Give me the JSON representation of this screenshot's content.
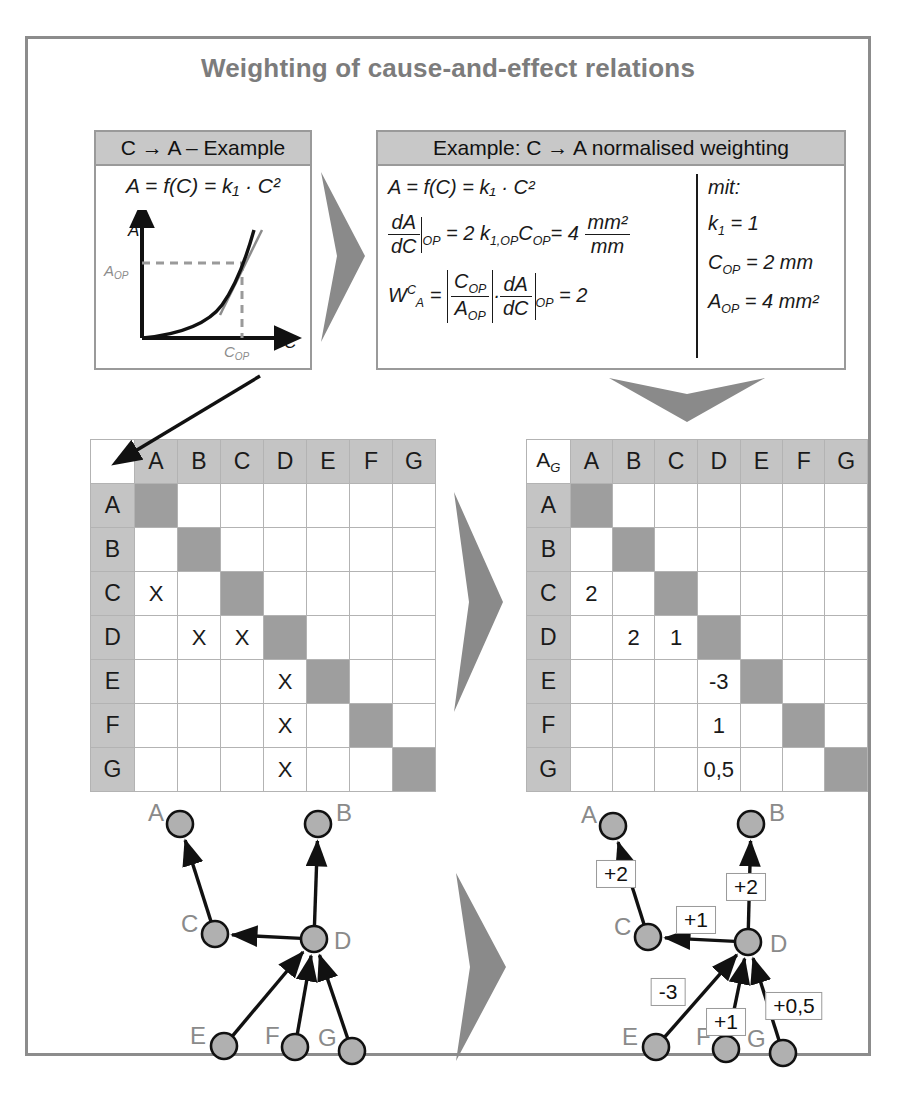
{
  "title": "Weighting of cause-and-effect relations",
  "example_left": {
    "header": "C → A – Example",
    "formula": "A = f(C) = k₁ · C²",
    "axis_y": "A",
    "axis_x": "C",
    "tick_y": "A",
    "tick_y_sub": "OP",
    "tick_x": "C",
    "tick_x_sub": "OP"
  },
  "example_right": {
    "header": "Example: C → A normalised weighting",
    "eq1": "A = f(C) = k₁ · C²",
    "eq2_lhs_num": "dA",
    "eq2_lhs_den": "dC",
    "eq2_at": "OP",
    "eq2_mid": "= 2 k",
    "eq2_k_sub": "1,OP",
    "eq2_c": "C",
    "eq2_c_sub": "OP",
    "eq2_eq": "= 4",
    "eq2_unit_num": "mm²",
    "eq2_unit_den": "mm",
    "eq3_w": "W",
    "eq3_w_sup": "C",
    "eq3_w_sub": "A",
    "eq3_eq": "=",
    "eq3_frac_num": "C",
    "eq3_frac_num_sub": "OP",
    "eq3_frac_den": "A",
    "eq3_frac_den_sub": "OP",
    "eq3_dot": "·",
    "eq3_dA": "dA",
    "eq3_dC": "dC",
    "eq3_at": "OP",
    "eq3_result": "= 2",
    "mit_label": "mit:",
    "mit_lines": [
      {
        "sym": "k",
        "sub": "1",
        "val": "= 1"
      },
      {
        "sym": "C",
        "sub": "OP",
        "val": "= 2 mm"
      },
      {
        "sym": "A",
        "sub": "OP",
        "val": "= 4 mm²"
      }
    ]
  },
  "matrix_left": {
    "corner": "",
    "columns": [
      "A",
      "B",
      "C",
      "D",
      "E",
      "F",
      "G"
    ],
    "rows": [
      "A",
      "B",
      "C",
      "D",
      "E",
      "F",
      "G"
    ],
    "cells": [
      [
        "",
        "",
        "",
        "",
        "",
        "",
        ""
      ],
      [
        "",
        "",
        "",
        "",
        "",
        "",
        ""
      ],
      [
        "X",
        "",
        "",
        "",
        "",
        "",
        ""
      ],
      [
        "",
        "X",
        "X",
        "",
        "",
        "",
        ""
      ],
      [
        "",
        "",
        "",
        "X",
        "",
        "",
        ""
      ],
      [
        "",
        "",
        "",
        "X",
        "",
        "",
        ""
      ],
      [
        "",
        "",
        "",
        "X",
        "",
        "",
        ""
      ]
    ]
  },
  "matrix_right": {
    "corner": "A",
    "corner_sub": "G",
    "columns": [
      "A",
      "B",
      "C",
      "D",
      "E",
      "F",
      "G"
    ],
    "rows": [
      "A",
      "B",
      "C",
      "D",
      "E",
      "F",
      "G"
    ],
    "cells": [
      [
        "",
        "",
        "",
        "",
        "",
        "",
        ""
      ],
      [
        "",
        "",
        "",
        "",
        "",
        "",
        ""
      ],
      [
        "2",
        "",
        "",
        "",
        "",
        "",
        ""
      ],
      [
        "",
        "2",
        "1",
        "",
        "",
        "",
        ""
      ],
      [
        "",
        "",
        "",
        "-3",
        "",
        "",
        ""
      ],
      [
        "",
        "",
        "",
        "1",
        "",
        "",
        ""
      ],
      [
        "",
        "",
        "",
        "0,5",
        "",
        "",
        ""
      ]
    ]
  },
  "graph_left": {
    "nodes": [
      {
        "id": "A",
        "label": "A",
        "x": 90,
        "y": 50,
        "label_dx": -32,
        "label_dy": -13
      },
      {
        "id": "B",
        "label": "B",
        "x": 228,
        "y": 50,
        "label_dx": 18,
        "label_dy": -13
      },
      {
        "id": "C",
        "label": "C",
        "x": 125,
        "y": 160,
        "label_dx": -34,
        "label_dy": -12
      },
      {
        "id": "D",
        "label": "D",
        "x": 224,
        "y": 165,
        "label_dx": 20,
        "label_dy": 0
      },
      {
        "id": "E",
        "label": "E",
        "x": 134,
        "y": 272,
        "label_dx": -34,
        "label_dy": -12
      },
      {
        "id": "F",
        "label": "F",
        "x": 205,
        "y": 273,
        "label_dx": -30,
        "label_dy": -13
      },
      {
        "id": "G",
        "label": "G",
        "x": 262,
        "y": 277,
        "label_dx": -34,
        "label_dy": -15
      }
    ],
    "edges": [
      {
        "from": "C",
        "to": "A"
      },
      {
        "from": "D",
        "to": "B"
      },
      {
        "from": "D",
        "to": "C"
      },
      {
        "from": "E",
        "to": "D"
      },
      {
        "from": "F",
        "to": "D"
      },
      {
        "from": "G",
        "to": "D"
      }
    ]
  },
  "graph_right": {
    "nodes": [
      {
        "id": "A",
        "label": "A",
        "x": 95,
        "y": 52,
        "label_dx": -32,
        "label_dy": -13
      },
      {
        "id": "B",
        "label": "B",
        "x": 233,
        "y": 50,
        "label_dx": 18,
        "label_dy": -13
      },
      {
        "id": "C",
        "label": "C",
        "x": 130,
        "y": 163,
        "label_dx": -34,
        "label_dy": -12
      },
      {
        "id": "D",
        "label": "D",
        "x": 230,
        "y": 168,
        "label_dx": 22,
        "label_dy": 0
      },
      {
        "id": "E",
        "label": "E",
        "x": 138,
        "y": 273,
        "label_dx": -34,
        "label_dy": -12
      },
      {
        "id": "F",
        "label": "F",
        "x": 208,
        "y": 275,
        "label_dx": -30,
        "label_dy": -14
      },
      {
        "id": "G",
        "label": "G",
        "x": 265,
        "y": 279,
        "label_dx": -36,
        "label_dy": -16
      }
    ],
    "edges": [
      {
        "from": "C",
        "to": "A",
        "weight": "+2",
        "lx": 98,
        "ly": 100
      },
      {
        "from": "D",
        "to": "B",
        "weight": "+2",
        "lx": 228,
        "ly": 113
      },
      {
        "from": "D",
        "to": "C",
        "weight": "+1",
        "lx": 178,
        "ly": 146
      },
      {
        "from": "E",
        "to": "D",
        "weight": "-3",
        "lx": 150,
        "ly": 218
      },
      {
        "from": "F",
        "to": "D",
        "weight": "+1",
        "lx": 208,
        "ly": 248
      },
      {
        "from": "G",
        "to": "D",
        "weight": "+0,5",
        "lx": 276,
        "ly": 232
      }
    ]
  },
  "colors": {
    "frame": "#8c8c8c",
    "title": "#7c7c7c",
    "panel_header": "#c8c8c8",
    "matrix_header": "#c4c4c4",
    "matrix_diagonal": "#9e9e9e",
    "node_fill": "#b0b0b0",
    "chevron": "#8a8a8a"
  }
}
